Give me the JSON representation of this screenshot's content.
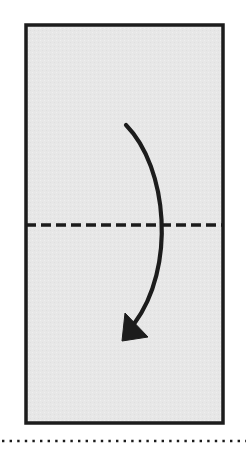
{
  "figure": {
    "kind": "origami-fold-step-diagram",
    "canvas": {
      "width": 248,
      "height": 450,
      "background": "#ffffff"
    },
    "paper": {
      "label": "paper-rectangle",
      "shape": "rectangle",
      "x": 26,
      "y": 25,
      "width": 197,
      "height": 398,
      "fill": "#e7e7e7",
      "stroke": "#1c1c1c",
      "stroke_width": 3.5
    },
    "crease_line": {
      "label": "horizontal-crease-line",
      "style": "dashed",
      "meaning": "valley fold crease",
      "x1": 26,
      "x2": 223,
      "y": 225,
      "stroke": "#1c1c1c",
      "stroke_width": 3.4,
      "dash": "10 5"
    },
    "fold_arrow": {
      "label": "fold-direction-arrow",
      "meaning": "fold top edge down over crease",
      "stroke": "#1c1c1c",
      "stroke_width": 4.2,
      "start": {
        "x": 126,
        "y": 125
      },
      "control_1": {
        "x": 168,
        "y": 168
      },
      "control_2": {
        "x": 176,
        "y": 268
      },
      "end": {
        "x": 134,
        "y": 324
      },
      "arrowhead": {
        "label": "arrowhead-down-left",
        "tip": {
          "x": 122,
          "y": 341
        },
        "points": "122,341 125,313 148,337"
      }
    },
    "bottom_dotted_rule": {
      "label": "bottom-dotted-separator",
      "y": 441,
      "x1": 2,
      "x2": 246,
      "dot_size": 2.4,
      "dot_gap": 5.2,
      "color": "#1c1c1c"
    }
  }
}
